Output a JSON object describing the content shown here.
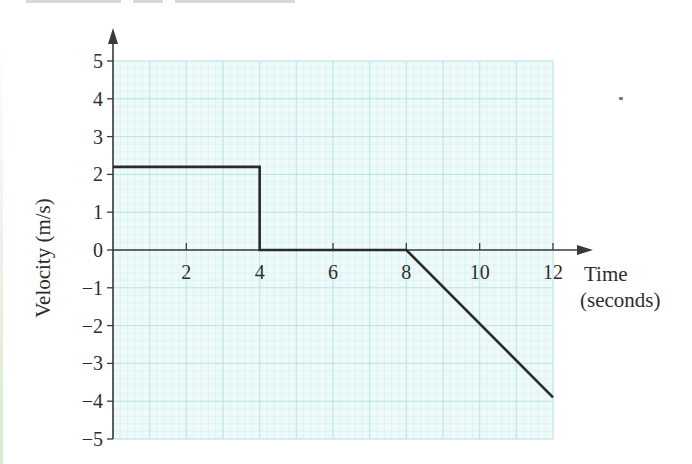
{
  "chart_data": {
    "type": "line",
    "title": "",
    "xlabel": "Time (seconds)",
    "xlabel_lines": [
      "Time",
      "(seconds)"
    ],
    "ylabel": "Velocity (m/s)",
    "xlim": [
      0,
      12
    ],
    "ylim": [
      -5,
      5
    ],
    "x_ticks": [
      2,
      4,
      6,
      8,
      10,
      12
    ],
    "x_tick_labels": [
      "2",
      "4",
      "6",
      "8",
      "10",
      "12"
    ],
    "y_ticks": [
      5,
      4,
      3,
      2,
      1,
      0,
      -1,
      -2,
      -3,
      -4,
      -5
    ],
    "y_tick_labels": [
      "5",
      "4",
      "3",
      "2",
      "1",
      "0",
      "−1",
      "−2",
      "−3",
      "−4",
      "−5"
    ],
    "grid": true,
    "grid_major_step": {
      "x": 2,
      "y": 1
    },
    "grid_minor_step": {
      "x": 0.4,
      "y": 0.2
    },
    "series": [
      {
        "name": "velocity",
        "points": [
          [
            0,
            2.2
          ],
          [
            4,
            2.2
          ],
          [
            4,
            0
          ],
          [
            8,
            0
          ],
          [
            12,
            -3.9
          ]
        ]
      }
    ]
  },
  "colors": {
    "grid_bg": "#eefafa",
    "grid_minor": "#d4f0f0",
    "grid_major": "#b9e6e6",
    "axis": "#3a3a3a",
    "line": "#2a2a2a"
  }
}
